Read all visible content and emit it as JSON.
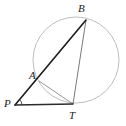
{
  "figure": {
    "type": "geometry-diagram",
    "background_color": "#ffffff",
    "width": 126,
    "height": 126
  },
  "colors": {
    "circle_stroke": "#b5b5b5",
    "secant_stroke": "#1c1c1c",
    "chord_stroke": "#7a7a7a",
    "tangent_stroke": "#2b2b2b",
    "label_color": "#1a1a1a",
    "angle_mark": "#3a3a3a"
  },
  "circle": {
    "name": "circumscribed-circle",
    "cx": 76,
    "cy": 60,
    "r": 43,
    "stroke_width": 0.9
  },
  "points": [
    {
      "id": "B",
      "label": "B",
      "x": 86,
      "y": 20,
      "label_x": 78,
      "label_y": 3
    },
    {
      "id": "A",
      "label": "A",
      "x": 39,
      "y": 81,
      "label_x": 29,
      "label_y": 70
    },
    {
      "id": "P",
      "label": "P",
      "x": 15,
      "y": 105,
      "label_x": 4,
      "label_y": 98
    },
    {
      "id": "T",
      "label": "T",
      "x": 73,
      "y": 104,
      "label_x": 69,
      "label_y": 110
    }
  ],
  "segments": [
    {
      "id": "PB",
      "name": "secant-line-p-to-b",
      "from": "P",
      "to": "B",
      "x1": 15,
      "y1": 105,
      "x2": 86,
      "y2": 20,
      "stroke": "#1c1c1c",
      "stroke_width": 1.6
    },
    {
      "id": "PT",
      "name": "tangent-line-p-to-t",
      "from": "P",
      "to": "T",
      "x1": 15,
      "y1": 105,
      "x2": 73,
      "y2": 104,
      "stroke": "#2b2b2b",
      "stroke_width": 1.5
    },
    {
      "id": "BT",
      "name": "chord-line-b-to-t",
      "from": "B",
      "to": "T",
      "x1": 86,
      "y1": 20,
      "x2": 73,
      "y2": 104,
      "stroke": "#7a7a7a",
      "stroke_width": 1.0
    },
    {
      "id": "AT",
      "name": "chord-line-a-to-t",
      "from": "A",
      "to": "T",
      "x1": 39,
      "y1": 81,
      "x2": 73,
      "y2": 104,
      "stroke": "#8a8a8a",
      "stroke_width": 0.9
    }
  ],
  "angle_marks": [
    {
      "id": "angle-P",
      "name": "angle-mark-at-p",
      "at": "P",
      "cx": 15,
      "cy": 105,
      "radius": 7,
      "stroke": "#3a3a3a"
    }
  ],
  "labels": {
    "B": "B",
    "A": "A",
    "P": "P",
    "T": "T"
  }
}
